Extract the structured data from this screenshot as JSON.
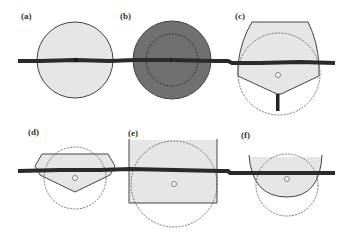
{
  "figure": {
    "colors": {
      "fill_light": "#e6e6e6",
      "fill_dark": "#707070",
      "outline": "#444444",
      "cable": "#2a2a2a",
      "dashed": "#555555",
      "background": "#ffffff"
    },
    "panels": [
      {
        "id": "a",
        "label": "(a)",
        "shape": "solid circle, light fill",
        "center": [
          75,
          60
        ]
      },
      {
        "id": "b",
        "label": "(b)",
        "shape": "solid circle, dark fill with inner dashed circle",
        "center": [
          171,
          60
        ]
      },
      {
        "id": "c",
        "label": "(c)",
        "shape": "hull with flat top, pointed bottom, keel stem; dashed circle",
        "center": [
          278,
          75
        ]
      },
      {
        "id": "d",
        "label": "(d)",
        "shape": "flat hexagonal hull, pointed bottom; dashed circle",
        "center": [
          75,
          178
        ]
      },
      {
        "id": "e",
        "label": "(e)",
        "shape": "open-top rectangle; dashed circle",
        "center": [
          174,
          184
        ]
      },
      {
        "id": "f",
        "label": "(f)",
        "shape": "U-shaped bowl arc; dashed circle",
        "center": [
          287,
          181
        ]
      }
    ],
    "cables": [
      {
        "row": "top",
        "from": [
          18,
          61
        ],
        "to": [
          335,
          63
        ]
      },
      {
        "row": "bottom",
        "from": [
          18,
          171
        ],
        "to": [
          335,
          173
        ]
      }
    ]
  }
}
